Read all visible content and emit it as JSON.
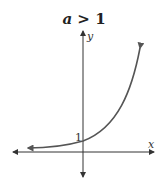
{
  "title": {
    "variable": "a",
    "condition": "> 1"
  },
  "axes": {
    "x_label": "x",
    "y_label": "y",
    "y_intercept_label": "1"
  },
  "colors": {
    "axis": "#333333",
    "curve": "#555555",
    "text": "#222222"
  },
  "curve": {
    "description": "exponential growth curve y = a^x with a > 1, passing through (0,1)",
    "arrows": "both ends"
  }
}
